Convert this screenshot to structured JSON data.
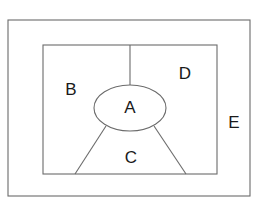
{
  "diagram": {
    "background_color": "#ffffff",
    "stroke_color": "#6b6b6b",
    "label_color": "#1a1a1a",
    "shapes": {
      "outer_rectangle": {
        "name": "outer-rectangle",
        "x": 8,
        "y": 20,
        "width": 242,
        "height": 176
      },
      "inner_rectangle": {
        "name": "inner-rectangle",
        "x": 43,
        "y": 45,
        "width": 174,
        "height": 129
      },
      "ellipse": {
        "name": "center-ellipse",
        "cx": 130,
        "cy": 108,
        "rx": 36,
        "ry": 23
      }
    },
    "dividers": [
      {
        "name": "top-vertical-divider",
        "x1": 130,
        "y1": 45,
        "x2": 130,
        "y2": 85
      },
      {
        "name": "left-diagonal-divider",
        "x1": 106,
        "y1": 126,
        "x2": 75,
        "y2": 174
      },
      {
        "name": "right-diagonal-divider",
        "x1": 154,
        "y1": 126,
        "x2": 186,
        "y2": 174
      }
    ],
    "labels": [
      {
        "id": "A",
        "text": "A",
        "x": 130,
        "y": 108,
        "region": "center-ellipse"
      },
      {
        "id": "B",
        "text": "B",
        "x": 71,
        "y": 90,
        "region": "inner-left"
      },
      {
        "id": "C",
        "text": "C",
        "x": 131,
        "y": 158,
        "region": "inner-bottom"
      },
      {
        "id": "D",
        "text": "D",
        "x": 185,
        "y": 74,
        "region": "inner-right"
      },
      {
        "id": "E",
        "text": "E",
        "x": 234,
        "y": 123,
        "region": "outer-ring"
      }
    ]
  }
}
